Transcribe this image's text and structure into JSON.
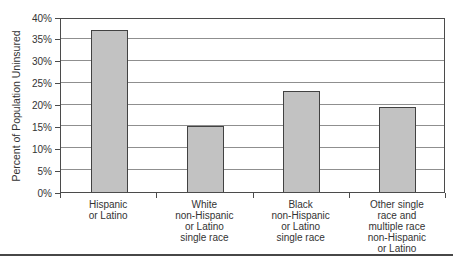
{
  "figure": {
    "background": "#ffffff",
    "bottom_rule_color": "#474747"
  },
  "chart_data": {
    "type": "bar",
    "title": "",
    "xlabel": "",
    "ylabel": "Percent of Population Uninsured",
    "ylim": [
      0,
      40
    ],
    "ytick_step": 5,
    "yticks": [
      "0%",
      "5%",
      "10%",
      "15%",
      "20%",
      "25%",
      "30%",
      "35%",
      "40%"
    ],
    "grid": true,
    "legend": "none",
    "categories": [
      "Hispanic or Latino",
      "White non-Hispanic or Latino single race",
      "Black non-Hispanic or Latino single race",
      "Other single race and multiple race non-Hispanic or Latino"
    ],
    "category_label_lines": [
      [
        "Hispanic",
        "or Latino"
      ],
      [
        "White",
        "non-Hispanic",
        "or Latino",
        "single race"
      ],
      [
        "Black",
        "non-Hispanic",
        "or Latino",
        "single race"
      ],
      [
        "Other single",
        "race and",
        "multiple race",
        "non-Hispanic",
        "or Latino"
      ]
    ],
    "values": [
      37,
      15,
      23,
      19.5
    ],
    "bar_fill": "#c2c2c2",
    "bar_border": "#424242",
    "gridline_color": "#8f8f8f",
    "axis_color": "#4b4b4b"
  }
}
